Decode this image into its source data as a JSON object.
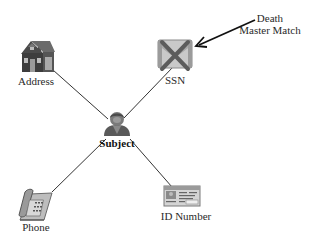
{
  "diagram": {
    "type": "hub-and-spoke link diagram",
    "center": {
      "id": "subject",
      "label": "Subject",
      "icon": "person-icon"
    },
    "nodes": [
      {
        "id": "address",
        "label": "Address",
        "icon": "house-icon",
        "flagged": false
      },
      {
        "id": "ssn",
        "label": "SSN",
        "icon": "ssn-card-icon",
        "flagged": true,
        "flag_mark": "crossed-out"
      },
      {
        "id": "phone",
        "label": "Phone",
        "icon": "phone-icon",
        "flagged": false
      },
      {
        "id": "id_number",
        "label": "ID Number",
        "icon": "id-card-icon",
        "flagged": false
      }
    ],
    "edges": [
      {
        "from": "subject",
        "to": "address"
      },
      {
        "from": "subject",
        "to": "ssn"
      },
      {
        "from": "subject",
        "to": "phone"
      },
      {
        "from": "subject",
        "to": "id_number"
      }
    ],
    "annotation": {
      "line1": "Death",
      "line2": "Master Match",
      "points_to": "ssn"
    }
  },
  "colors": {
    "line": "#333333",
    "icon_gray": "#8a8a8a",
    "icon_dark": "#4a4a4a",
    "cross": "#5a5a5a",
    "background": "#ffffff"
  }
}
